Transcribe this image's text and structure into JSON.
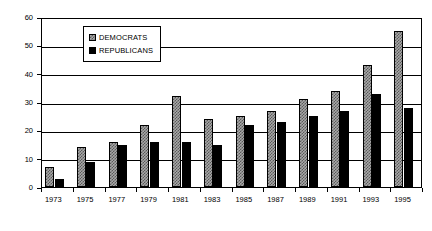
{
  "chart_data": {
    "type": "bar",
    "title": "",
    "subtitle": "",
    "xlabel": "",
    "ylabel": "",
    "categories": [
      "1973",
      "1975",
      "1977",
      "1979",
      "1981",
      "1983",
      "1985",
      "1987",
      "1989",
      "1991",
      "1993",
      "1995"
    ],
    "series": [
      {
        "name": "DEMOCRATS",
        "values": [
          7,
          14,
          16,
          22,
          32,
          24,
          25,
          27,
          31,
          34,
          43,
          55
        ],
        "fill": "checkered-gray",
        "color": "#a8a8a8"
      },
      {
        "name": "REPUBLICANS",
        "values": [
          3,
          9,
          15,
          16,
          16,
          15,
          22,
          23,
          25,
          27,
          33,
          28
        ],
        "fill": "solid-black",
        "color": "#000000"
      }
    ],
    "ylim": [
      0,
      60
    ],
    "y_ticks": [
      0,
      10,
      20,
      30,
      40,
      50,
      60
    ],
    "y_tick_labels": [
      "0",
      "10",
      "20",
      "30",
      "40",
      "50",
      "60"
    ],
    "grid": true,
    "grid_axis": "y",
    "legend_position": "upper-left-inside",
    "frame": true,
    "annotations": []
  },
  "legend": {
    "entries": [
      {
        "label": "DEMOCRATS",
        "swatch": "democrats-swatch"
      },
      {
        "label": "REPUBLICANS",
        "swatch": "republicans-swatch"
      }
    ]
  }
}
